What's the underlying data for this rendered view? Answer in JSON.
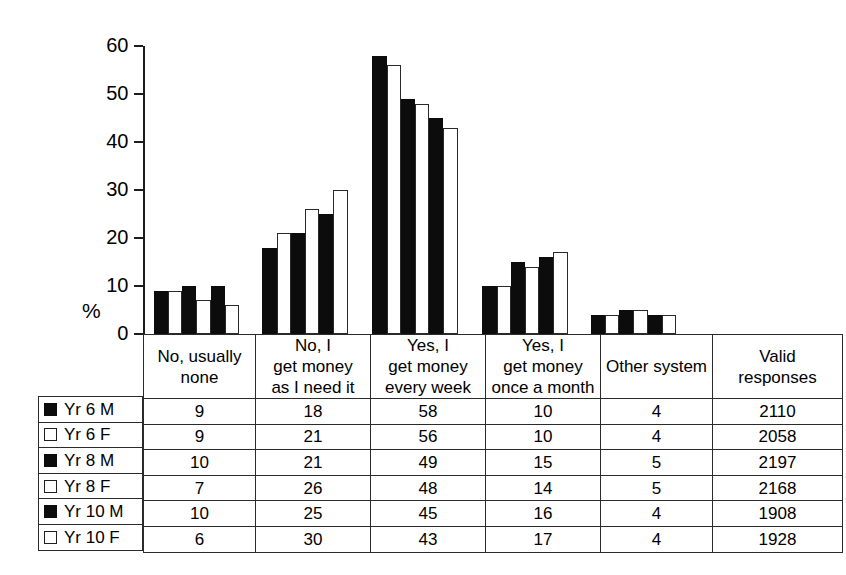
{
  "chart_data": {
    "type": "bar",
    "title": "",
    "subtitle": "",
    "xlabel": "",
    "ylabel": "%",
    "ylim": [
      0,
      60
    ],
    "yticks": [
      0,
      10,
      20,
      30,
      40,
      50,
      60
    ],
    "grid": false,
    "legend_position": "table-left",
    "categories": [
      "No, usually none",
      "No, I get money as I need it",
      "Yes, I get money every week",
      "Yes, I get money once a month",
      "Other system"
    ],
    "series": [
      {
        "name": "Yr 6 M",
        "fill": "black",
        "values": [
          9,
          18,
          58,
          10,
          4
        ]
      },
      {
        "name": "Yr 6 F",
        "fill": "white",
        "values": [
          9,
          21,
          56,
          10,
          4
        ]
      },
      {
        "name": "Yr 8 M",
        "fill": "black",
        "values": [
          10,
          21,
          49,
          15,
          5
        ]
      },
      {
        "name": "Yr 8 F",
        "fill": "white",
        "values": [
          7,
          26,
          48,
          14,
          5
        ]
      },
      {
        "name": "Yr 10 M",
        "fill": "black",
        "values": [
          10,
          25,
          45,
          16,
          4
        ]
      },
      {
        "name": "Yr 10 F",
        "fill": "white",
        "values": [
          6,
          30,
          43,
          17,
          4
        ]
      }
    ],
    "valid_responses": [
      2110,
      2058,
      2197,
      2168,
      1908,
      1928
    ]
  },
  "axis": {
    "y_label": "%",
    "ticks": [
      "60",
      "50",
      "40",
      "30",
      "20",
      "10",
      "0"
    ]
  },
  "table": {
    "headers": [
      {
        "lines": [
          "No, usually",
          "none"
        ]
      },
      {
        "lines": [
          "No, I",
          "get money",
          "as I need it"
        ]
      },
      {
        "lines": [
          "Yes, I",
          "get money",
          "every week"
        ]
      },
      {
        "lines": [
          "Yes, I",
          "get money",
          "once a month"
        ]
      },
      {
        "lines": [
          "Other system"
        ]
      },
      {
        "lines": [
          "Valid",
          "responses"
        ]
      }
    ],
    "rows": [
      {
        "legend": "Yr 6 M",
        "swatch": "filled",
        "cells": [
          "9",
          "18",
          "58",
          "10",
          "4",
          "2110"
        ]
      },
      {
        "legend": "Yr 6 F",
        "swatch": "hollow",
        "cells": [
          "9",
          "21",
          "56",
          "10",
          "4",
          "2058"
        ]
      },
      {
        "legend": "Yr 8 M",
        "swatch": "filled",
        "cells": [
          "10",
          "21",
          "49",
          "15",
          "5",
          "2197"
        ]
      },
      {
        "legend": "Yr 8 F",
        "swatch": "hollow",
        "cells": [
          "7",
          "26",
          "48",
          "14",
          "5",
          "2168"
        ]
      },
      {
        "legend": "Yr 10 M",
        "swatch": "filled",
        "cells": [
          "10",
          "25",
          "45",
          "16",
          "4",
          "1908"
        ]
      },
      {
        "legend": "Yr 10 F",
        "swatch": "hollow",
        "cells": [
          "6",
          "30",
          "43",
          "17",
          "4",
          "1928"
        ]
      }
    ]
  },
  "colors": {
    "bar_black": "#0c0c0c",
    "bar_white": "#ffffff",
    "line": "#2b2b2b",
    "background": "#ffffff"
  }
}
